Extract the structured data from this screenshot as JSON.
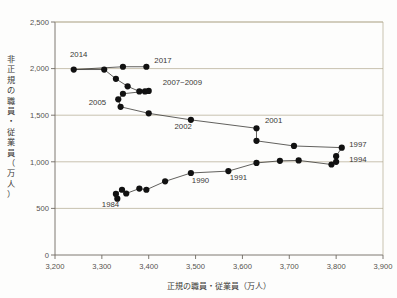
{
  "chart_data": {
    "type": "scatter",
    "title": "",
    "xlabel": "正規の職員・従業員（万人）",
    "ylabel": "非正規の職員・従業員（万人）",
    "xlim": [
      3200,
      3900
    ],
    "ylim": [
      0,
      2500
    ],
    "xticks": [
      "3,200",
      "3,300",
      "3,400",
      "3,500",
      "3,600",
      "3,700",
      "3,800",
      "3,900"
    ],
    "xtick_values": [
      3200,
      3300,
      3400,
      3500,
      3600,
      3700,
      3800,
      3900
    ],
    "yticks": [
      "0",
      "500",
      "1,000",
      "1,500",
      "2,000",
      "2,500"
    ],
    "ytick_values": [
      0,
      500,
      1000,
      1500,
      2000,
      2500
    ],
    "grid": "horizontal",
    "legend": "none",
    "connected": true,
    "series": [
      {
        "name": "正規・非正規の職員／従業員",
        "points": [
          {
            "label": "1984",
            "x": 3333,
            "y": 604
          },
          {
            "label": "",
            "x": 3330,
            "y": 655
          },
          {
            "label": "",
            "x": 3343,
            "y": 700
          },
          {
            "label": "",
            "x": 3352,
            "y": 660
          },
          {
            "label": "",
            "x": 3380,
            "y": 713
          },
          {
            "label": "",
            "x": 3395,
            "y": 700
          },
          {
            "label": "",
            "x": 3435,
            "y": 790
          },
          {
            "label": "1990",
            "x": 3490,
            "y": 880
          },
          {
            "label": "1991",
            "x": 3570,
            "y": 900
          },
          {
            "label": "",
            "x": 3630,
            "y": 988
          },
          {
            "label": "",
            "x": 3680,
            "y": 1010
          },
          {
            "label": "",
            "x": 3720,
            "y": 1015
          },
          {
            "label": "1994",
            "x": 3790,
            "y": 971
          },
          {
            "label": "",
            "x": 3800,
            "y": 1000
          },
          {
            "label": "",
            "x": 3800,
            "y": 1060
          },
          {
            "label": "1997",
            "x": 3812,
            "y": 1152
          },
          {
            "label": "",
            "x": 3710,
            "y": 1170
          },
          {
            "label": "",
            "x": 3630,
            "y": 1225
          },
          {
            "label": "2001",
            "x": 3630,
            "y": 1360
          },
          {
            "label": "2002",
            "x": 3490,
            "y": 1450
          },
          {
            "label": "",
            "x": 3400,
            "y": 1520
          },
          {
            "label": "2005",
            "x": 3340,
            "y": 1590
          },
          {
            "label": "",
            "x": 3335,
            "y": 1670
          },
          {
            "label": "",
            "x": 3345,
            "y": 1730
          },
          {
            "label": "2007~2009",
            "x": 3400,
            "y": 1760
          },
          {
            "label": "",
            "x": 3392,
            "y": 1755
          },
          {
            "label": "",
            "x": 3380,
            "y": 1755
          },
          {
            "label": "",
            "x": 3355,
            "y": 1810
          },
          {
            "label": "",
            "x": 3330,
            "y": 1890
          },
          {
            "label": "",
            "x": 3305,
            "y": 1990
          },
          {
            "label": "2014",
            "x": 3240,
            "y": 1990
          },
          {
            "label": "",
            "x": 3345,
            "y": 2020
          },
          {
            "label": "2017",
            "x": 3395,
            "y": 2020
          }
        ]
      }
    ],
    "annotations": [
      {
        "text": "2014",
        "x": 3232,
        "y": 2120,
        "anchor": "start"
      },
      {
        "text": "2017",
        "x": 3412,
        "y": 2065,
        "anchor": "start"
      },
      {
        "text": "2007~2009",
        "x": 3430,
        "y": 1820,
        "anchor": "start"
      },
      {
        "text": "2005",
        "x": 3272,
        "y": 1610,
        "anchor": "start"
      },
      {
        "text": "2002",
        "x": 3455,
        "y": 1350,
        "anchor": "start"
      },
      {
        "text": "2001",
        "x": 3648,
        "y": 1420,
        "anchor": "start"
      },
      {
        "text": "1997",
        "x": 3828,
        "y": 1155,
        "anchor": "start"
      },
      {
        "text": "1994",
        "x": 3828,
        "y": 1000,
        "anchor": "start"
      },
      {
        "text": "1991",
        "x": 3573,
        "y": 800,
        "anchor": "start"
      },
      {
        "text": "1990",
        "x": 3492,
        "y": 770,
        "anchor": "start"
      },
      {
        "text": "1984",
        "x": 3300,
        "y": 520,
        "anchor": "start"
      }
    ]
  },
  "colors": {
    "marker": "#111111",
    "line": "#3a3835",
    "grid": "#b2a98f",
    "axis": "#6f6a62",
    "text": "#3a3835",
    "background": "#fdfdfc"
  },
  "ytitle_chars": [
    "非",
    "正",
    "規",
    "の",
    "職",
    "員",
    "・",
    "従",
    "業",
    "員",
    "（",
    "万",
    "人",
    "）"
  ]
}
